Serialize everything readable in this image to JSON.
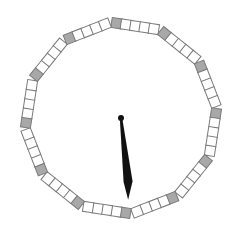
{
  "dial": {
    "center": [
      121,
      118
    ],
    "radius": 96,
    "rotation_deg": -3,
    "segments": 12,
    "squares_per_segment": 5,
    "square_size": 10,
    "colors": {
      "background": "#ffffff",
      "square_fill": "#ffffff",
      "marker_fill": "#a8a8a8",
      "square_stroke": "#7a7a7a",
      "hand": "#111111"
    }
  },
  "hand": {
    "name": "minute-hand",
    "angle_deg": 175,
    "length": 82,
    "pivot_radius": 3
  }
}
